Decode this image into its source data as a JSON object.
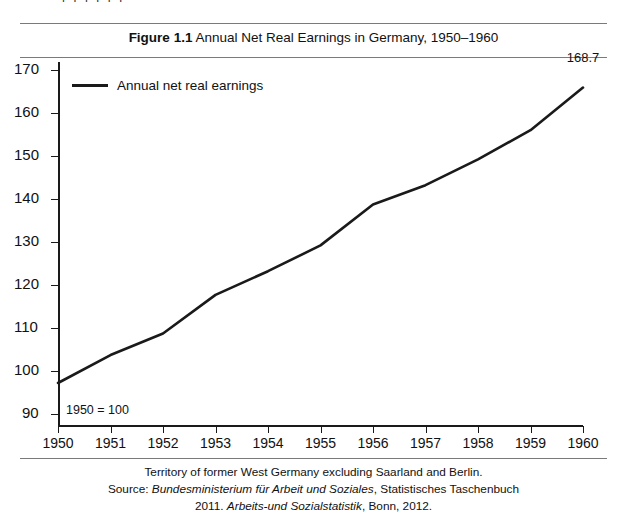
{
  "page": {
    "bleed_text_above": "p p  p  p      p    p"
  },
  "figure": {
    "title_number": "Figure 1.1",
    "title_text": "Annual Net Real Earnings in Germany, 1950–1960",
    "base_note": "1950 = 100",
    "endpoint_label": "168.7",
    "footnote_line1": "Territory of former West Germany excluding Saarland and Berlin.",
    "footnote_line2_prefix": "Source: ",
    "footnote_line2_italic": "Bundesministerium für Arbeit und Soziales",
    "footnote_line2_suffix": ", Statistisches Taschenbuch",
    "footnote_line3_prefix": "2011. ",
    "footnote_line3_italic": "Arbeits-und Sozialstatistik",
    "footnote_line3_suffix": ", Bonn, 2012."
  },
  "colors": {
    "line": "#1a1a1a",
    "axis": "#1a1a1a",
    "rule": "#7a7a7a",
    "background": "#ffffff"
  },
  "chart_data": {
    "type": "line",
    "title": "Figure 1.1 Annual Net Real Earnings in Germany, 1950–1960",
    "xlabel": "",
    "ylabel": "",
    "x": [
      1950,
      1951,
      1952,
      1953,
      1954,
      1955,
      1956,
      1957,
      1958,
      1959,
      1960
    ],
    "categories": [
      "1950",
      "1951",
      "1952",
      "1953",
      "1954",
      "1955",
      "1956",
      "1957",
      "1958",
      "1959",
      "1960"
    ],
    "series": [
      {
        "name": "Annual net real earnings",
        "values": [
          100.0,
          106.5,
          111.5,
          120.5,
          126.0,
          132.0,
          141.5,
          146.0,
          152.0,
          158.8,
          168.7
        ]
      }
    ],
    "yticks": [
      90,
      100,
      110,
      120,
      130,
      140,
      150,
      160,
      170
    ],
    "ylim": [
      90,
      170
    ],
    "xlim": [
      1950,
      1960
    ],
    "grid": false,
    "legend_position": "top-left",
    "index_base": "1950 = 100",
    "annotations": [
      {
        "label": "168.7",
        "x": 1960,
        "y": 168.7
      },
      {
        "label": "1950 = 100",
        "x": 1950,
        "y": 92
      }
    ]
  }
}
